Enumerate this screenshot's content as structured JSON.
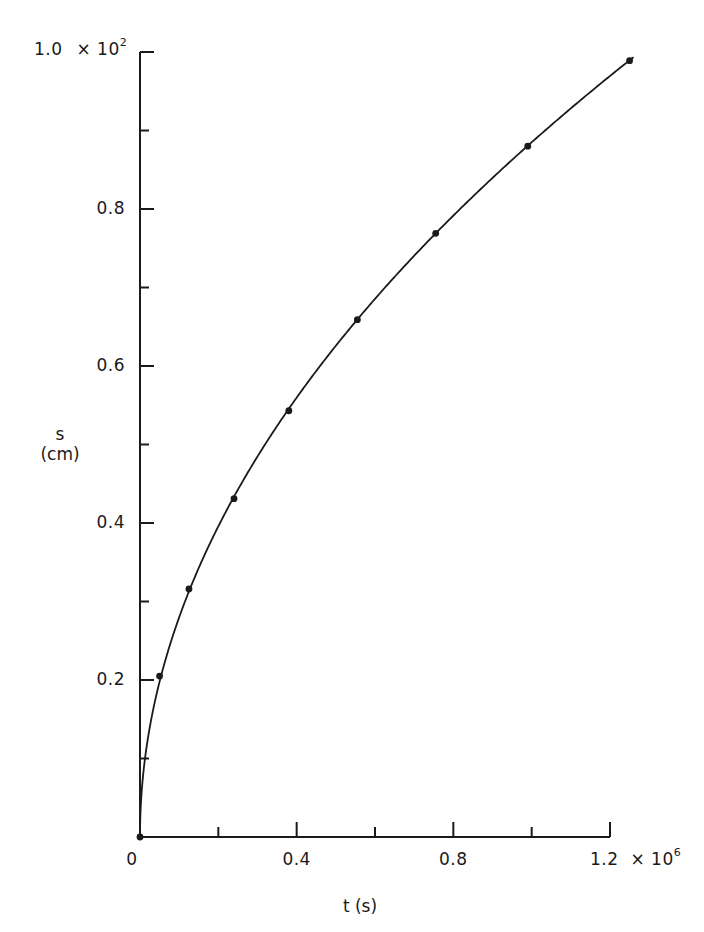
{
  "chart_data": {
    "type": "scatter",
    "title": "",
    "xlabel": "t (s)",
    "ylabel": "s (cm)",
    "ylabel_line1": "s",
    "ylabel_line2": "(cm)",
    "x_multiplier": "× 10",
    "x_multiplier_exp": "6",
    "y_multiplier": "× 10",
    "y_multiplier_exp": "2",
    "xlim": [
      0,
      1.2
    ],
    "ylim": [
      0,
      1.0
    ],
    "x_ticks_major": [
      0,
      0.4,
      0.8,
      1.2
    ],
    "x_tick_labels": [
      "0",
      "0.4",
      "0.8",
      "1.2"
    ],
    "x_ticks_minor": [
      0.2,
      0.6,
      1.0
    ],
    "y_ticks_major": [
      0.2,
      0.4,
      0.6,
      0.8,
      1.0
    ],
    "y_tick_labels": [
      "0.2",
      "0.4",
      "0.6",
      "0.8",
      "1.0"
    ],
    "y_ticks_minor": [
      0.1,
      0.3,
      0.5,
      0.7,
      0.9
    ],
    "grid": false,
    "legend": null,
    "series": [
      {
        "name": "measured",
        "kind": "points",
        "x": [
          0,
          0.05,
          0.125,
          0.24,
          0.38,
          0.555,
          0.755,
          0.99,
          1.25
        ],
        "y": [
          0,
          0.205,
          0.316,
          0.431,
          0.543,
          0.659,
          0.769,
          0.88,
          0.989
        ]
      },
      {
        "name": "fit",
        "kind": "curve",
        "equation": "s = 0.885 * sqrt(t)",
        "coefficient": 0.885,
        "t_end": 1.26
      }
    ]
  },
  "colors": {
    "ink": "#1a1a1a",
    "background": "#ffffff"
  }
}
